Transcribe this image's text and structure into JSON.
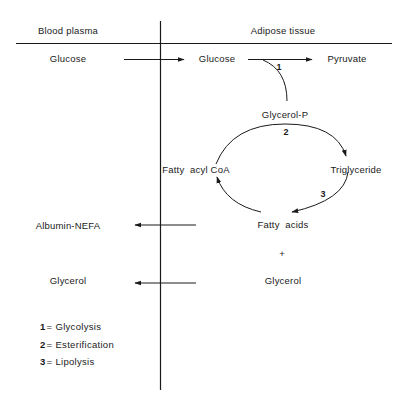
{
  "headers": {
    "left": "Blood plasma",
    "right": "Adipose tissue"
  },
  "plasma": {
    "glucose": "Glucose",
    "albumin_nefa": "Albumin-NEFA",
    "glycerol": "Glycerol"
  },
  "tissue": {
    "glucose": "Glucose",
    "pyruvate": "Pyruvate",
    "glycerol_p": "Glycerol-P",
    "fatty_acyl_coa": "Fatty  acyl CoA",
    "triglyceride": "Triglyceride",
    "fatty_acids": "Fatty  acids",
    "plus": "+",
    "glycerol": "Glycerol"
  },
  "step_numbers": {
    "glycolysis": "1",
    "esterification": "2",
    "lipolysis": "3"
  },
  "legend": [
    {
      "key": "1",
      "eq": "=",
      "label": "Glycolysis"
    },
    {
      "key": "2",
      "eq": "=",
      "label": "Esterification"
    },
    {
      "key": "3",
      "eq": "=",
      "label": "Lipolysis"
    }
  ],
  "colors": {
    "ink": "#1a1a1a",
    "background": "#ffffff"
  }
}
